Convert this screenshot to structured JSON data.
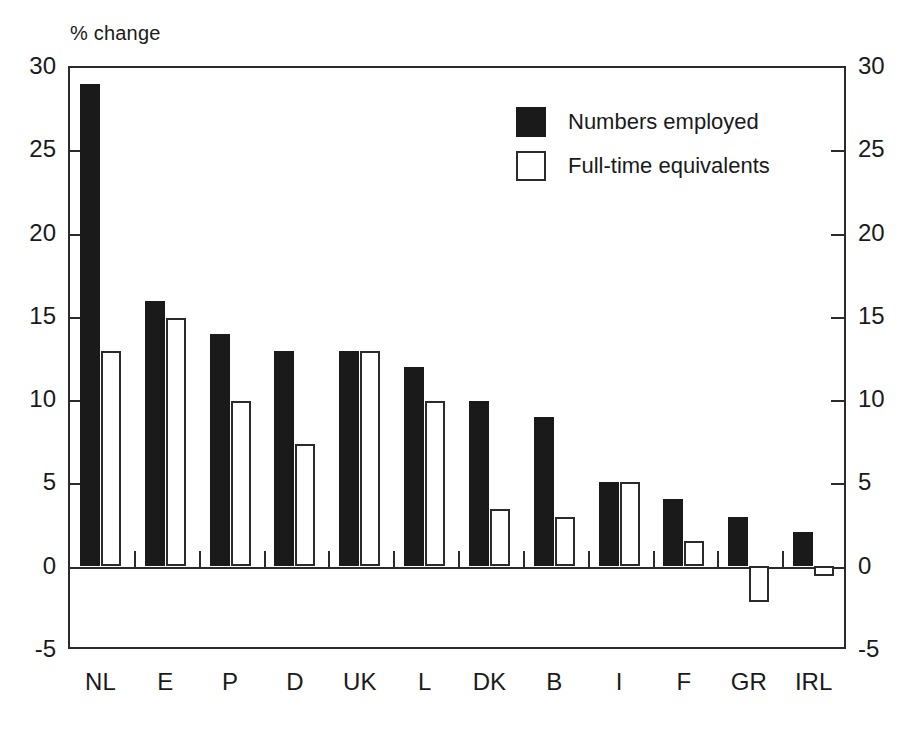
{
  "chart_data": {
    "type": "bar",
    "title": "",
    "subtitle": "",
    "unit_label": "% change",
    "xlabel": "",
    "ylabel": "% change",
    "ylim": [
      -5,
      30
    ],
    "ytick_step": 5,
    "yticks": [
      "30",
      "25",
      "20",
      "15",
      "10",
      "5",
      "0",
      "-5"
    ],
    "ytick_values": [
      30,
      25,
      20,
      15,
      10,
      5,
      0,
      -5
    ],
    "right_axis_yticks": [
      "30",
      "25",
      "20",
      "15",
      "10",
      "5",
      "0",
      "-5"
    ],
    "grid": false,
    "legend_position": "upper right",
    "categories": [
      "NL",
      "E",
      "P",
      "D",
      "UK",
      "L",
      "DK",
      "B",
      "I",
      "F",
      "GR",
      "IRL"
    ],
    "series": [
      {
        "name": "Numbers employed",
        "style": "filled",
        "color": "#1a1a1a",
        "values": [
          28.9,
          15.9,
          13.9,
          12.9,
          12.9,
          11.9,
          9.9,
          8.9,
          5.0,
          4.0,
          2.9,
          2.0
        ]
      },
      {
        "name": "Full-time equivalents",
        "style": "hollow",
        "color": "#ffffff",
        "edge_color": "#2b2b2b",
        "values": [
          12.9,
          14.9,
          9.9,
          7.3,
          12.9,
          9.9,
          3.4,
          2.9,
          5.0,
          1.5,
          -2.2,
          -0.6
        ]
      }
    ],
    "annotations": []
  },
  "colors": {
    "axis": "#2b2b2b",
    "series_filled": "#1a1a1a",
    "series_hollow_fill": "#ffffff",
    "background": "#ffffff"
  }
}
